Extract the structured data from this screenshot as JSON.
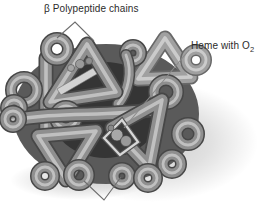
{
  "figure": {
    "labels": {
      "beta_chains": "β Polypeptide chains",
      "heme_text": "Heme with O",
      "heme_subscript": "2"
    },
    "colors": {
      "background": "#ffffff",
      "tube_mid_gray": "#8f8f8f",
      "tube_dark_gray": "#474747",
      "tube_highlight": "#c9c9c9",
      "heme_plane_light": "#d8d8d8",
      "label_text": "#2b2b2b",
      "leader_line": "#6e6e6e",
      "shadow_gray": "#c9c9c9"
    }
  }
}
